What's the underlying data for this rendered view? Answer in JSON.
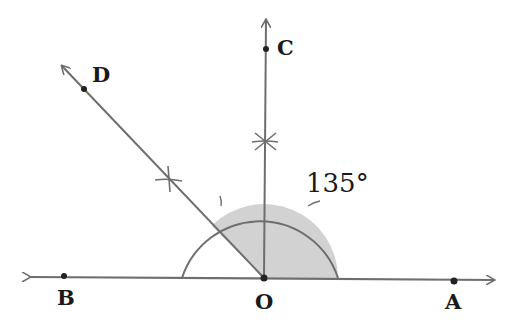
{
  "diagram": {
    "type": "geometry-construction",
    "points": {
      "O": {
        "label": "O",
        "x": 264,
        "y": 278
      },
      "A": {
        "label": "A",
        "x": 454,
        "y": 281
      },
      "B": {
        "label": "B",
        "x": 64,
        "y": 276
      },
      "C": {
        "label": "C",
        "x": 266,
        "y": 49
      },
      "D": {
        "label": "D",
        "x": 84,
        "y": 89
      }
    },
    "angle_label": "135°",
    "colors": {
      "line": "#6e6e6e",
      "shade": "#cfcfcf",
      "point": "#222222",
      "text": "#1a1a1a"
    }
  }
}
